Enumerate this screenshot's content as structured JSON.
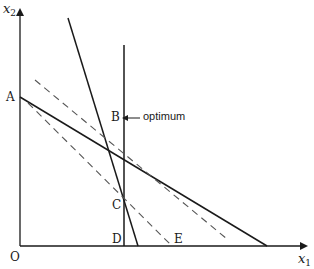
{
  "diagram": {
    "type": "linear-programming-graph",
    "axes": {
      "x_label": "x",
      "x_sub": "1",
      "y_label": "x",
      "y_sub": "2",
      "origin_label": "O"
    },
    "points": {
      "A": "A",
      "B": "B",
      "C": "C",
      "D": "D",
      "E": "E"
    },
    "annotation": "optimum",
    "colors": {
      "line": "#1a1a1a",
      "dashed": "#555555",
      "background": "#ffffff"
    },
    "lines": [
      {
        "name": "constraint-A",
        "style": "solid",
        "from": [
          20,
          97
        ],
        "to": [
          267,
          246
        ]
      },
      {
        "name": "constraint-steep",
        "style": "solid",
        "from": [
          68,
          18
        ],
        "to": [
          138,
          246
        ]
      },
      {
        "name": "constraint-vertical-D",
        "style": "solid",
        "from": [
          124,
          45
        ],
        "to": [
          124,
          246
        ]
      },
      {
        "name": "objective-upper",
        "style": "dashed",
        "from": [
          35,
          80
        ],
        "to": [
          227,
          239
        ]
      },
      {
        "name": "objective-lower",
        "style": "dashed",
        "from": [
          28,
          103
        ],
        "to": [
          172,
          246
        ]
      }
    ]
  }
}
